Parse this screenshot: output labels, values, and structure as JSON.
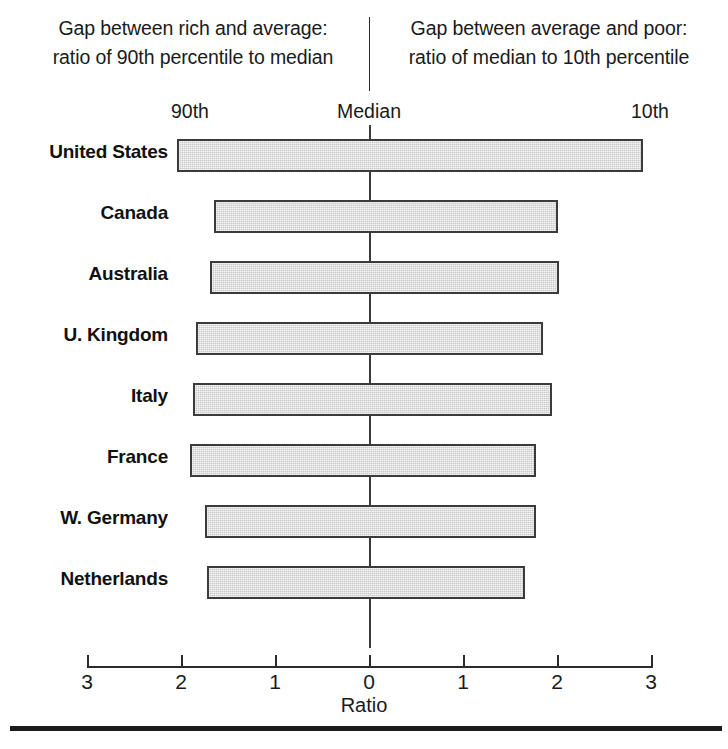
{
  "header": {
    "left_caption_line1": "Gap between rich and average:",
    "left_caption_line2": "ratio of 90th percentile to median",
    "right_caption_line1": "Gap between average and poor:",
    "right_caption_line2": "ratio of median to 10th percentile",
    "sub_left": "90th",
    "sub_center": "Median",
    "sub_right": "10th"
  },
  "colors": {
    "bar_fill": "#c9c9c9",
    "bar_border": "#3b3b3b",
    "axis": "#2b2b2b",
    "text": "#111111"
  },
  "chart_data": {
    "type": "bar",
    "title": "",
    "subtitle": "",
    "xlabel": "Ratio",
    "ylabel": "",
    "orientation": "horizontal",
    "diverging": true,
    "xlim": [
      -3,
      3
    ],
    "xticks": [
      -3,
      -2,
      -1,
      0,
      1,
      2,
      3
    ],
    "xtick_labels": [
      "3",
      "2",
      "1",
      "0",
      "1",
      "2",
      "3"
    ],
    "grid": false,
    "legend": "none",
    "note": "Left half: ratio of 90th percentile to median. Right half: ratio of median to 10th percentile.",
    "categories": [
      "United States",
      "Canada",
      "Australia",
      "U. Kingdom",
      "Italy",
      "France",
      "W. Germany",
      "Netherlands"
    ],
    "series": [
      {
        "name": "ratio of 90th percentile to median",
        "side": "left",
        "values": [
          2.04,
          1.65,
          1.69,
          1.84,
          1.87,
          1.9,
          1.74,
          1.72
        ]
      },
      {
        "name": "ratio of median to 10th percentile",
        "side": "right",
        "values": [
          2.91,
          2.01,
          2.02,
          1.85,
          1.95,
          1.78,
          1.78,
          1.66
        ]
      }
    ]
  }
}
